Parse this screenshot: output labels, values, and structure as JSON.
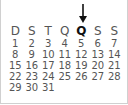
{
  "calendar": {
    "highlighted_day_index": 4,
    "weekdays": [
      "D",
      "S",
      "T",
      "Q",
      "Q",
      "S",
      "S"
    ],
    "weeks": [
      [
        "1",
        "2",
        "3",
        "4",
        "5",
        "6",
        "7"
      ],
      [
        "8",
        "9",
        "10",
        "11",
        "12",
        "13",
        "14"
      ],
      [
        "15",
        "16",
        "17",
        "18",
        "19",
        "20",
        "21"
      ],
      [
        "22",
        "23",
        "24",
        "25",
        "26",
        "27",
        "28"
      ],
      [
        "29",
        "30",
        "31",
        "",
        "",
        "",
        ""
      ]
    ],
    "indicator_icon": "arrow-down-icon"
  }
}
